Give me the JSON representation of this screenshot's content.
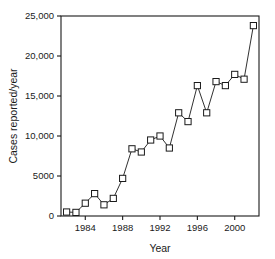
{
  "chart_data": {
    "type": "line",
    "title": "",
    "xlabel": "Year",
    "ylabel": "Cases reported/year",
    "xlim": [
      1981.4,
      2002.6
    ],
    "ylim": [
      0,
      25000
    ],
    "grid": false,
    "legend": false,
    "marker": "open-square",
    "x": [
      1982,
      1983,
      1984,
      1985,
      1986,
      1987,
      1988,
      1989,
      1990,
      1991,
      1992,
      1993,
      1994,
      1995,
      1996,
      1997,
      1998,
      1999,
      2000,
      2001,
      2002
    ],
    "values": [
      500,
      450,
      1600,
      2800,
      1400,
      2200,
      4700,
      8400,
      8000,
      9500,
      10000,
      8500,
      12900,
      11800,
      16300,
      12900,
      16800,
      16300,
      17700,
      17100,
      23800
    ],
    "xticks": [
      1984,
      1988,
      1992,
      1996,
      2000
    ],
    "xticklabels": [
      "1984",
      "1988",
      "1992",
      "1996",
      "2000"
    ],
    "yticks": [
      0,
      5000,
      10000,
      15000,
      20000,
      25000
    ],
    "yticklabels": [
      "0",
      "5000",
      "10,000",
      "15,000",
      "20,000",
      "25,000"
    ],
    "series_color": "#1a1a1a",
    "background_color": "#ffffff"
  }
}
